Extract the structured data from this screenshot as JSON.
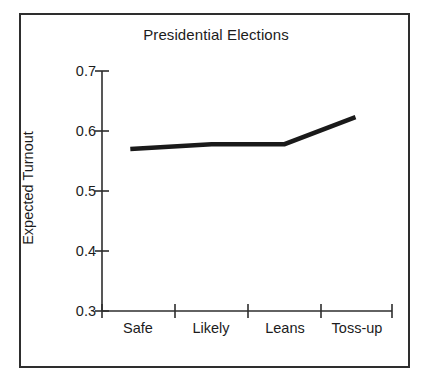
{
  "chart_data": {
    "type": "line",
    "title": "Presidential Elections",
    "xlabel": "",
    "ylabel": "Expected Turnout",
    "categories": [
      "Safe",
      "Likely",
      "Leans",
      "Toss-up"
    ],
    "values": [
      0.57,
      0.578,
      0.578,
      0.623
    ],
    "series": [
      {
        "name": "Expected Turnout",
        "values": [
          0.57,
          0.578,
          0.578,
          0.623
        ]
      }
    ],
    "ylim": [
      0.3,
      0.7
    ],
    "ytick_labels": [
      "0.7",
      "0.6",
      "0.5",
      "0.4",
      "0.3"
    ],
    "ytick_values": [
      0.7,
      0.6,
      0.5,
      0.4,
      0.3
    ],
    "xtick_labels": [
      "Safe",
      "Likely",
      "Leans",
      "Toss-up"
    ],
    "grid": false,
    "legend": "none",
    "line_color": "#1a1a1a",
    "axis_color": "#2e2e2e",
    "background": "#ffffff"
  },
  "figure": {
    "border_color": "#2e2e2e"
  }
}
